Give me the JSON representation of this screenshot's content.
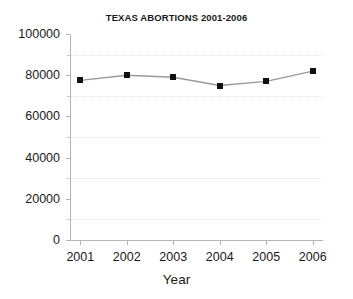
{
  "chart_data": {
    "type": "line",
    "title": "TEXAS ABORTIONS 2001-2006",
    "xlabel": "Year",
    "ylabel": "",
    "categories": [
      "2001",
      "2002",
      "2003",
      "2004",
      "2005",
      "2006"
    ],
    "x": [
      2001,
      2002,
      2003,
      2004,
      2005,
      2006
    ],
    "values": [
      77500,
      80000,
      79000,
      75000,
      77000,
      82000
    ],
    "series": [
      {
        "name": "Texas abortions",
        "values": [
          77500,
          80000,
          79000,
          75000,
          77000,
          82000
        ]
      }
    ],
    "ylim": [
      0,
      100000
    ],
    "xlim": [
      2000.8,
      2006.2
    ],
    "y_ticks": [
      0,
      20000,
      40000,
      60000,
      80000,
      100000
    ],
    "y_tick_labels": [
      "0",
      "20000",
      "40000",
      "60000",
      "80000",
      "100000"
    ],
    "y_minor_ticks": [
      10000,
      30000,
      50000,
      70000,
      90000
    ],
    "x_ticks": [
      2001,
      2002,
      2003,
      2004,
      2005,
      2006
    ],
    "x_tick_labels": [
      "2001",
      "2002",
      "2003",
      "2004",
      "2005",
      "2006"
    ],
    "grid": "horizontal-dotted-minor",
    "legend": "none",
    "line_color": "#9a9a9a",
    "marker_color": "#111111",
    "marker_style": "square",
    "axis_color": "#b4b4b4",
    "grid_color": "#e2e2e2",
    "background_color": "#ffffff"
  },
  "figure": {
    "title": "TEXAS ABORTIONS 2001-2006",
    "x_axis_title": "Year"
  }
}
